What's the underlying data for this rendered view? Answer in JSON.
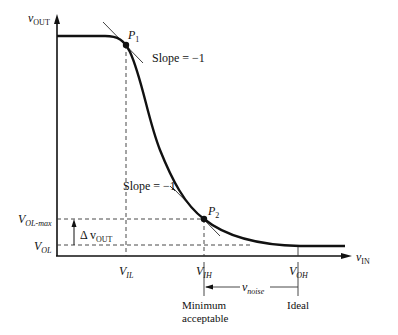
{
  "diagram": {
    "type": "voltage-transfer-characteristic",
    "y_axis": {
      "var": "v",
      "sub": "OUT"
    },
    "x_axis": {
      "var": "v",
      "sub": "IN"
    },
    "points": {
      "p1": {
        "label": "P",
        "sub": "1",
        "slope_label": "Slope = −1"
      },
      "p2": {
        "label": "P",
        "sub": "2",
        "slope_label": "Slope = −1"
      }
    },
    "y_levels": {
      "vol_max": {
        "var": "V",
        "sub": "OL-max"
      },
      "vol": {
        "var": "V",
        "sub": "OL"
      },
      "delta": {
        "prefix": "Δ v",
        "sub": "OUT"
      }
    },
    "x_levels": {
      "vil": {
        "var": "V",
        "sub": "IL"
      },
      "vih": {
        "var": "V",
        "sub": "IH"
      },
      "voh": {
        "var": "V",
        "sub": "OH"
      }
    },
    "noise": {
      "var": "v",
      "sub": "noise"
    },
    "annotations": {
      "min_line1": "Minimum",
      "min_line2": "acceptable",
      "ideal": "Ideal"
    }
  }
}
